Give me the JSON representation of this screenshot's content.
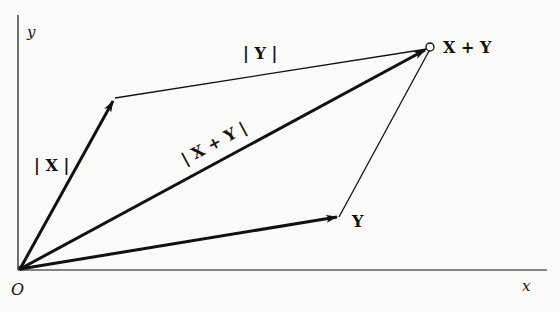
{
  "diagram": {
    "axes": {
      "x_label": "x",
      "y_label": "y",
      "origin_label": "O"
    },
    "vectors": [
      {
        "name": "X",
        "label": "| X |",
        "from": "O",
        "to": "X"
      },
      {
        "name": "Y",
        "label": "Y",
        "from": "O",
        "to": "Y"
      },
      {
        "name": "X + Y",
        "label": "| X + Y |",
        "from": "O",
        "to": "X + Y"
      }
    ],
    "labels": {
      "y_axis": "y",
      "x_axis": "x",
      "origin": "O",
      "norm_x": "| X |",
      "norm_y": "| Y |",
      "norm_sum": "| X + Y |",
      "point_y": "Y",
      "point_sum": "X + Y"
    },
    "colors": {
      "ink": "#111111",
      "background": "#fbfbfa"
    }
  }
}
